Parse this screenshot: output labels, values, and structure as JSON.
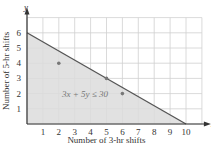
{
  "chart_data": {
    "type": "line",
    "title": "",
    "xlabel": "Number of 3-hr shifts",
    "ylabel": "Number of 5-hr shifts",
    "x_axis_letter": "x",
    "y_axis_letter": "y",
    "xlim": [
      0,
      11
    ],
    "ylim": [
      0,
      7
    ],
    "x_ticks": [
      1,
      2,
      3,
      4,
      5,
      6,
      7,
      8,
      9,
      10
    ],
    "y_ticks": [
      1,
      2,
      3,
      4,
      5,
      6
    ],
    "grid": true,
    "boundary_line": {
      "equation": "3x + 5y = 30",
      "points": [
        [
          0,
          6
        ],
        [
          10,
          0
        ]
      ]
    },
    "shaded_region": {
      "inequality": "3x + 5y ≤ 30",
      "vertices": [
        [
          0,
          0
        ],
        [
          0,
          6
        ],
        [
          10,
          0
        ]
      ],
      "color": "#dcdcdc"
    },
    "points": [
      [
        2,
        4
      ],
      [
        5,
        3
      ],
      [
        6,
        2
      ]
    ],
    "annotation": "3x + 5y ≤ 30",
    "colors": {
      "line": "#555555",
      "fill": "#dcdcdc",
      "grid": "#d0d0d0",
      "points": "#777777"
    }
  }
}
